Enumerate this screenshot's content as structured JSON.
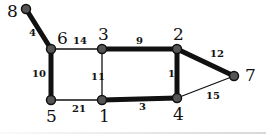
{
  "graph": {
    "nodes": [
      {
        "id": "8",
        "x": 26,
        "y": 9,
        "lx": 7,
        "ly": 17
      },
      {
        "id": "6",
        "x": 51,
        "y": 49,
        "lx": 57,
        "ly": 44
      },
      {
        "id": "3",
        "x": 102,
        "y": 49,
        "lx": 98,
        "ly": 40
      },
      {
        "id": "2",
        "x": 177,
        "y": 49,
        "lx": 173,
        "ly": 40
      },
      {
        "id": "7",
        "x": 234,
        "y": 76,
        "lx": 245,
        "ly": 81
      },
      {
        "id": "5",
        "x": 51,
        "y": 100,
        "lx": 46,
        "ly": 122
      },
      {
        "id": "1",
        "x": 102,
        "y": 100,
        "lx": 99,
        "ly": 122
      },
      {
        "id": "4",
        "x": 177,
        "y": 98,
        "lx": 173,
        "ly": 120
      }
    ],
    "edges": [
      {
        "from": "8",
        "to": "6",
        "weight": "4",
        "bold": true,
        "lx": 29,
        "ly": 36
      },
      {
        "from": "6",
        "to": "3",
        "weight": "14",
        "bold": false,
        "lx": 73,
        "ly": 44
      },
      {
        "from": "3",
        "to": "2",
        "weight": "9",
        "bold": true,
        "lx": 136,
        "ly": 44
      },
      {
        "from": "2",
        "to": "7",
        "weight": "12",
        "bold": true,
        "lx": 210,
        "ly": 57
      },
      {
        "from": "6",
        "to": "5",
        "weight": "10",
        "bold": true,
        "lx": 32,
        "ly": 77
      },
      {
        "from": "3",
        "to": "1",
        "weight": "11",
        "bold": false,
        "lx": 91,
        "ly": 80
      },
      {
        "from": "2",
        "to": "4",
        "weight": "1",
        "bold": true,
        "lx": 168,
        "ly": 77
      },
      {
        "from": "5",
        "to": "1",
        "weight": "21",
        "bold": false,
        "lx": 72,
        "ly": 112
      },
      {
        "from": "1",
        "to": "4",
        "weight": "3",
        "bold": true,
        "lx": 139,
        "ly": 110
      },
      {
        "from": "4",
        "to": "7",
        "weight": "15",
        "bold": false,
        "lx": 206,
        "ly": 99
      }
    ]
  },
  "colors": {
    "edge": "#111111",
    "node_fill": "#555555",
    "node_stroke": "#111111"
  }
}
